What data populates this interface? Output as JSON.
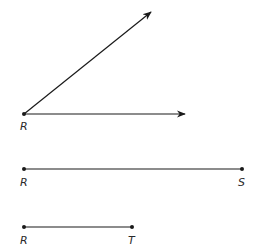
{
  "diagram": {
    "angle": {
      "vertex_label": "R",
      "rays": [
        "upper-ray",
        "horizontal-ray"
      ]
    },
    "segment_rs": {
      "start_label": "R",
      "end_label": "S"
    },
    "segment_rt": {
      "start_label": "R",
      "end_label": "T"
    },
    "colors": {
      "stroke": "#1a1a1a",
      "label": "#2a2a2a"
    }
  }
}
